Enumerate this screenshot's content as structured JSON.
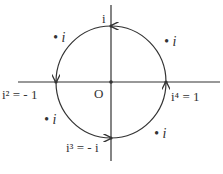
{
  "diagram": {
    "origin_label": "O",
    "points": {
      "top": "i",
      "left": "i² = - 1",
      "bottom": "i³ = - i",
      "right": "i⁴ = 1"
    },
    "multiplier_labels": [
      "• i",
      "• i",
      "• i",
      "• i"
    ],
    "colors": {
      "stroke": "#333333",
      "background": "#ffffff"
    }
  }
}
